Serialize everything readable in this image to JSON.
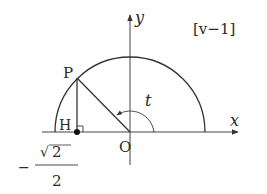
{
  "figure": {
    "tag": "[v−1]",
    "axes": {
      "x_label": "x",
      "y_label": "y",
      "origin_label": "O"
    },
    "points": {
      "P": {
        "label": "P"
      },
      "H": {
        "label": "H"
      }
    },
    "angle_label": "t",
    "h_coordinate": {
      "sign": "−",
      "numerator_radical": "√",
      "numerator_value": "2",
      "denominator": "2"
    },
    "colors": {
      "stroke": "#333333",
      "background": "#ffffff"
    }
  }
}
